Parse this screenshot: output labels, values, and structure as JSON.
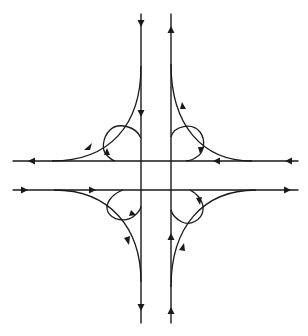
{
  "diagram": {
    "type": "cloverleaf-interchange",
    "colors": {
      "line": "#1a1a1a",
      "background": "#ffffff"
    },
    "mainline_vertical": [
      {
        "id": "southbound",
        "x": 141,
        "y_start": 14,
        "y_end": 323,
        "direction": "down"
      },
      {
        "id": "northbound",
        "x": 171,
        "y_start": 14,
        "y_end": 323,
        "direction": "up"
      }
    ],
    "mainline_horizontal": [
      {
        "id": "westbound",
        "y": 161,
        "x_start": 13,
        "x_end": 298,
        "direction": "left"
      },
      {
        "id": "eastbound",
        "y": 190,
        "x_start": 13,
        "x_end": 298,
        "direction": "right"
      }
    ],
    "outer_ramps": [
      {
        "quadrant": "top-left",
        "from": "southbound",
        "to": "westbound"
      },
      {
        "quadrant": "top-right",
        "from": "westbound",
        "to": "northbound"
      },
      {
        "quadrant": "bottom-left",
        "from": "eastbound",
        "to": "southbound"
      },
      {
        "quadrant": "bottom-right",
        "from": "northbound",
        "to": "eastbound"
      }
    ],
    "loop_ramps": [
      {
        "quadrant": "top-left"
      },
      {
        "quadrant": "top-right"
      },
      {
        "quadrant": "bottom-left"
      },
      {
        "quadrant": "bottom-right"
      }
    ]
  }
}
